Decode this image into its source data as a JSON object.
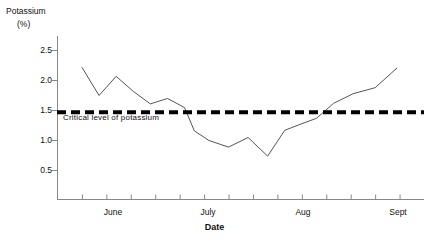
{
  "chart_data": {
    "type": "line",
    "title": "",
    "subtitle": "",
    "ylabel": "Potassium",
    "yunit": "(%)",
    "xlabel": "Date",
    "ylim": [
      0.0,
      2.75
    ],
    "xlim": [
      0,
      15
    ],
    "grid": false,
    "legend": null,
    "yticks": [
      0.5,
      1.0,
      1.5,
      2.0,
      2.5
    ],
    "ytick_labels": [
      "0.5",
      "1.0",
      "1.5",
      "2.0",
      "2.5"
    ],
    "xticks": [
      1,
      2,
      3,
      4,
      5,
      6,
      7,
      8,
      9,
      10,
      11,
      12,
      13,
      14
    ],
    "xtick_labels": [
      "June",
      "July",
      "Aug",
      "Sept"
    ],
    "xtick_label_positions": [
      1.5,
      5.5,
      9.5,
      13.5
    ],
    "series": [
      {
        "name": "Potassium (%)",
        "x": [
          1.0,
          1.7,
          2.4,
          3.1,
          3.8,
          4.5,
          5.2,
          5.6,
          6.2,
          7.0,
          7.8,
          8.6,
          9.3,
          10.0,
          10.6,
          11.3,
          12.1,
          13.0,
          13.9
        ],
        "values": [
          2.22,
          1.75,
          2.07,
          1.82,
          1.61,
          1.7,
          1.55,
          1.16,
          1.0,
          0.89,
          1.05,
          0.74,
          1.17,
          1.28,
          1.37,
          1.62,
          1.78,
          1.88,
          2.21
        ],
        "color": "#555555"
      }
    ],
    "annotations": [
      {
        "name": "critical-level",
        "type": "hline",
        "value": 1.47,
        "label": "Critical level of potassium",
        "style": "dashed",
        "color": "#000000"
      }
    ]
  }
}
